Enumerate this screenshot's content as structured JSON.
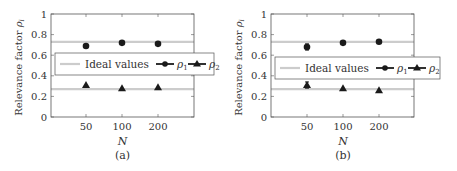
{
  "chart_data": [
    {
      "type": "scatter",
      "panel_label": "(a)",
      "xlabel": "N",
      "ylabel": "Relevance factor ρi",
      "categories": [
        "50",
        "100",
        "200"
      ],
      "ylim": [
        0,
        1
      ],
      "yticks": [
        "0",
        "0.2",
        "0.4",
        "0.6",
        "0.8",
        "1"
      ],
      "grid": false,
      "legend_position": "center (overlapping plot)",
      "ideal_values": {
        "rho1": 0.73,
        "rho2": 0.27
      },
      "series": [
        {
          "name": "ρ1",
          "marker": "circle",
          "values": [
            0.69,
            0.72,
            0.71
          ]
        },
        {
          "name": "ρ2",
          "marker": "triangle",
          "values": [
            0.31,
            0.28,
            0.29
          ]
        }
      ]
    },
    {
      "type": "scatter",
      "panel_label": "(b)",
      "xlabel": "N",
      "ylabel": "Relevance factor ρi",
      "categories": [
        "50",
        "100",
        "200"
      ],
      "ylim": [
        0,
        1
      ],
      "yticks": [
        "0",
        "0.2",
        "0.4",
        "0.6",
        "0.8",
        "1"
      ],
      "grid": false,
      "legend_position": "center (overlapping plot)",
      "ideal_values": {
        "rho1": 0.73,
        "rho2": 0.27
      },
      "series": [
        {
          "name": "ρ1",
          "marker": "circle",
          "values": [
            0.68,
            0.72,
            0.73
          ],
          "error_bars": [
            0.03,
            0,
            0
          ]
        },
        {
          "name": "ρ2",
          "marker": "triangle",
          "values": [
            0.31,
            0.28,
            0.26
          ],
          "error_bars": [
            0.03,
            0,
            0
          ]
        }
      ]
    }
  ],
  "legend": {
    "ideal": "Ideal values",
    "rho1": "ρ",
    "rho1_sub": "1",
    "rho2": "ρ",
    "rho2_sub": "2"
  },
  "axis": {
    "ylabel_main": "Relevance factor ",
    "ylabel_sym": "ρ",
    "ylabel_sub": "i",
    "xlabel": "N",
    "yticks": [
      "0",
      "0.2",
      "0.4",
      "0.6",
      "0.8",
      "1"
    ],
    "xticks": [
      "50",
      "100",
      "200"
    ]
  },
  "captions": {
    "a": "(a)",
    "b": "(b)"
  },
  "colors": {
    "ideal_line": "#cccccc",
    "marker": "#1a1a1a",
    "axis": "#555555"
  }
}
